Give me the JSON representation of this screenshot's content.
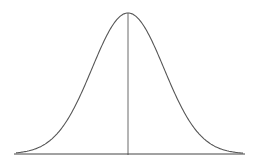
{
  "diagram": {
    "type": "normal-distribution-curve",
    "colors": {
      "background": "#ffffff",
      "curve": "#555555",
      "axis": "#444444"
    },
    "geometry": {
      "baseline_y": 154,
      "x_start": 14,
      "x_end": 245,
      "center_x": 128,
      "peak_y": 13,
      "sigma_px": 36
    }
  }
}
